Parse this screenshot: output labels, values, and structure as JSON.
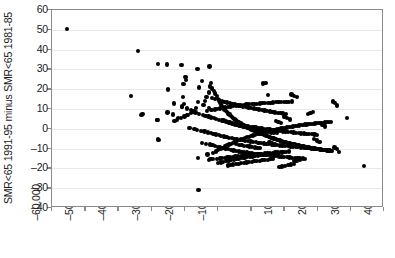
{
  "chart_data": {
    "type": "scatter",
    "title": "",
    "xlabel": "",
    "ylabel": "SMR<65 1991-95 minus SMR<65 1981-85",
    "xlim": [
      -60000,
      40000
    ],
    "ylim": [
      -40,
      60
    ],
    "xticks": [
      -60000,
      -50000,
      -40000,
      -30000,
      -20000,
      -10000,
      0,
      10000,
      20000,
      30000,
      40000
    ],
    "xtick_labels": [
      "–60,000",
      "–50,000",
      "–40,000",
      "–30,000",
      "–20,000",
      "–10,000",
      "0",
      "10,000",
      "20,000",
      "30,000",
      "40,000"
    ],
    "yticks": [
      -40,
      -30,
      -20,
      -10,
      0,
      10,
      20,
      30,
      40,
      50,
      60
    ],
    "ytick_labels": [
      "–40",
      "–30",
      "–20",
      "–10",
      "0",
      "10",
      "20",
      "30",
      "40",
      "50",
      "60"
    ],
    "grid": "horizontal",
    "legend": "none",
    "marker_color": "#000000",
    "marker_size": 4,
    "n_points": 620,
    "x": [
      -55400,
      -34100,
      -36200,
      -32700,
      -33000,
      -28100,
      -25400,
      -28200,
      -23600,
      -28300,
      -27800,
      -28100,
      -25000,
      -23200,
      -22100,
      -20600,
      -20300,
      -20800,
      -19800,
      -19600,
      -21000,
      -20400,
      -12600,
      -16200,
      -14900,
      -12200,
      -15800,
      -12400,
      -12800,
      -13500,
      -13900,
      -14400,
      -16700,
      -17200,
      -18100,
      -19200,
      -20100,
      -21200,
      -22400,
      -23100,
      -11800,
      -11200,
      -10900,
      -10400,
      -10100,
      -9800,
      -9400,
      -9100,
      -8700,
      -8300,
      -8000,
      -7600,
      -7200,
      -6900,
      -6500,
      -6100,
      -5800,
      -5400,
      -5000,
      -4700,
      -4300,
      -3900,
      -3600,
      -3200,
      -2800,
      -2500,
      -2100,
      -1700,
      -1400,
      -1000,
      -600,
      -300,
      100,
      500,
      900,
      1200,
      1600,
      2000,
      2300,
      2700,
      3100,
      3400,
      3800,
      4200,
      4500,
      4900,
      5300,
      5600,
      6000,
      6400,
      6700,
      7100,
      7500,
      7800,
      8200,
      8600,
      8900,
      9300,
      9700,
      10000,
      10400,
      10800,
      11100,
      11500,
      11900,
      12200,
      12600,
      13000,
      13300,
      13700,
      14100,
      14400,
      14800,
      15200,
      15500,
      15900,
      16300,
      16600,
      17000,
      17400,
      17700,
      18100,
      18500,
      18800,
      19200,
      19600,
      19900,
      20300,
      20700,
      21000,
      21400,
      21800,
      22100,
      22500,
      22900,
      23200,
      23600,
      24000,
      24300,
      25100,
      25800,
      26400,
      28900,
      33900,
      -15900,
      -12300,
      -16100,
      -13200,
      -11600,
      -10700,
      -9900,
      -9200,
      -8500,
      -7900,
      -7300,
      -6700,
      -6000,
      -5500,
      -4800,
      -4200,
      -3600,
      -3000,
      -2400,
      -1800,
      -1200,
      -600,
      0,
      600,
      1200,
      1800,
      2400,
      3000,
      3600,
      4200,
      4800,
      5400,
      6000,
      6600,
      7200,
      7800,
      8400,
      9000,
      9600,
      10200,
      10800,
      11400,
      12000,
      12600,
      13200,
      13800,
      14400,
      15000,
      15600,
      16200,
      16800,
      17400,
      18000,
      18600,
      19200,
      19800,
      20400,
      21000,
      21600,
      22200,
      22800,
      23400,
      24000,
      24600,
      25200,
      25800,
      -20900,
      -19400,
      -18200,
      -17500,
      -16800,
      -15700,
      -14600,
      -13800,
      -12900,
      -12100,
      -11300,
      -10500,
      -9700,
      -8900,
      -8100,
      -7300,
      -6500,
      -5700,
      -4900,
      -4100,
      -3300,
      -2500,
      -1700,
      -900,
      -100,
      700,
      1500,
      2300,
      3100,
      3900,
      4700,
      5500,
      6300,
      7100,
      7900,
      8700,
      9500,
      10300,
      11100,
      11900,
      12700,
      13500,
      14300,
      15100,
      15900,
      16700,
      17500,
      18300,
      19100,
      19900,
      20700,
      21500,
      22300,
      -18600,
      -17100,
      -16300,
      -15200,
      -14100,
      -13100,
      -12200,
      -11400,
      -10600,
      -9800,
      -9000,
      -8200,
      -7400,
      -6600,
      -5800,
      -5000,
      -4200,
      -3400,
      -2600,
      -1800,
      -1000,
      -200,
      600,
      1400,
      2200,
      3000,
      3800,
      4600,
      5400,
      6200,
      7000,
      7800,
      8600,
      9400,
      10200,
      11000,
      11800,
      12600,
      13400,
      14200,
      15000,
      15800,
      16600,
      17400,
      18200,
      19000,
      19800,
      20600,
      -14800,
      -13600,
      -12500,
      -11700,
      -10900,
      -10100,
      -9300,
      -8500,
      -7700,
      -6900,
      -6100,
      -5300,
      -4500,
      -3700,
      -2900,
      -2100,
      -1300,
      -500,
      300,
      1100,
      1900,
      2700,
      3500,
      4300,
      5100,
      5900,
      6700,
      7500,
      8300,
      9100,
      9900,
      10700,
      11500,
      12300,
      13100,
      13900,
      14700,
      15500,
      16300,
      17100,
      17900,
      18700,
      -13400,
      -12000,
      -11000,
      -10200,
      -9400,
      -8600,
      -7800,
      -7000,
      -6200,
      -5400,
      -4600,
      -3800,
      -3000,
      -2200,
      -1400,
      -600,
      200,
      1000,
      1800,
      2600,
      3400,
      4200,
      5000,
      5800,
      6600,
      7400,
      8200,
      9000,
      9800,
      10600,
      11400,
      12200,
      13000,
      13800,
      14600,
      -12700,
      -11500,
      -10300,
      -9500,
      -8700,
      -7900,
      -7100,
      -6300,
      -5500,
      -4700,
      -3900,
      -3100,
      -2300,
      -1500,
      -700,
      100,
      900,
      1700,
      2500,
      3300,
      4100,
      4900,
      5700,
      6500,
      7300,
      8100,
      8900,
      9700,
      10500,
      11300,
      12100,
      12900,
      13700,
      -11900,
      -10800,
      -9600,
      -8800,
      -8000,
      -7200,
      -6400,
      -5600,
      -4800,
      -4000,
      -3200,
      -2400,
      -1600,
      -800,
      0,
      800,
      1600,
      2400,
      3200,
      4000,
      4800,
      5600,
      6400,
      7200,
      8000,
      8800,
      9600,
      10400,
      11200,
      12000,
      12800,
      -10000,
      -9200,
      -8400,
      -7600,
      -6800,
      -6000,
      -5200,
      -4400,
      -3600,
      -2800,
      -2000,
      -1200,
      -400,
      400,
      1200,
      2000,
      2800,
      3600,
      4400,
      5200,
      6000,
      6800,
      7600,
      8400,
      9200,
      10000,
      10800,
      11600,
      -8300,
      -7500,
      -6700,
      -5900,
      -5100,
      -4300,
      -3500,
      -2700,
      -1900,
      -1100,
      -300,
      500,
      1300,
      2100,
      2900,
      3700,
      4500,
      5300,
      6100,
      6900,
      7700,
      8500,
      9300,
      10100,
      -7000,
      -6200,
      -5400,
      -4600,
      -3800,
      -3000,
      -2200,
      -1400,
      -600,
      200,
      1000,
      1800,
      2600,
      3400,
      4200,
      5000,
      5800,
      6600,
      7400,
      8200,
      9000,
      -5600,
      -4900,
      -4100,
      -3300,
      -2500,
      -1700,
      -900,
      -100,
      700,
      1500,
      2300,
      3100,
      3900,
      4700,
      5500,
      6300,
      7100,
      -4500,
      -3700,
      -2900,
      -2100,
      -1300,
      -500,
      300,
      1100,
      1900,
      2700,
      3500,
      4300,
      5100,
      -16000,
      -12800,
      -25200,
      -23900,
      -22700,
      -21600
    ],
    "y": [
      50.3,
      39.4,
      16.5,
      7.5,
      6.8,
      32.7,
      32.5,
      4.6,
      7.2,
      4.3,
      -5.5,
      -5.4,
      19.8,
      12.8,
      5.6,
      15.9,
      12.4,
      11.3,
      26.0,
      24.8,
      32.2,
      22.6,
      31.5,
      30.2,
      24.0,
      23.1,
      20.8,
      21.4,
      18.3,
      16.2,
      14.1,
      12.0,
      10.5,
      9.1,
      8.0,
      7.1,
      6.2,
      5.4,
      4.6,
      3.8,
      20.4,
      19.2,
      17.8,
      16.4,
      15.2,
      14.3,
      13.1,
      12.2,
      11.4,
      10.6,
      9.8,
      9.1,
      8.4,
      7.8,
      7.2,
      6.6,
      6.0,
      5.5,
      5.0,
      4.5,
      4.0,
      3.6,
      3.2,
      2.8,
      2.4,
      2.0,
      1.6,
      1.3,
      0.9,
      0.6,
      0.3,
      0.0,
      -0.3,
      -0.6,
      -0.9,
      -1.2,
      -1.5,
      -1.8,
      -2.0,
      -2.3,
      -2.6,
      -2.8,
      -3.1,
      -3.3,
      -3.6,
      -3.8,
      -4.0,
      -4.3,
      -4.5,
      -4.7,
      -4.9,
      -5.1,
      -5.3,
      -5.5,
      -5.7,
      -5.9,
      -6.1,
      -6.3,
      -6.5,
      -6.6,
      -6.8,
      -7.0,
      -7.1,
      -7.3,
      -7.5,
      -7.6,
      -7.8,
      -7.9,
      -8.1,
      -8.2,
      -8.4,
      -8.5,
      -8.6,
      -8.8,
      -8.9,
      -9.0,
      -9.1,
      -9.3,
      -9.4,
      -9.5,
      -9.6,
      -9.7,
      -9.8,
      -9.9,
      -10.0,
      -10.1,
      -10.2,
      -10.3,
      -10.4,
      -10.5,
      -10.6,
      -10.6,
      -10.7,
      -10.8,
      -10.9,
      -10.9,
      -11.0,
      -11.1,
      -11.1,
      -9.5,
      -10.3,
      -11.8,
      5.4,
      -18.9,
      -31.0,
      -15.1,
      -14.8,
      -13.0,
      -12.2,
      -11.5,
      -10.8,
      -10.2,
      -9.6,
      -9.0,
      -8.5,
      -8.0,
      -7.5,
      -7.0,
      -6.6,
      -6.2,
      -5.8,
      -5.4,
      -5.0,
      -4.7,
      -4.3,
      -4.0,
      -3.7,
      -3.4,
      -3.1,
      -2.8,
      -2.5,
      -2.2,
      -2.0,
      -1.7,
      -1.5,
      -1.2,
      -1.0,
      -0.8,
      -0.5,
      -0.3,
      -0.1,
      0.1,
      0.3,
      0.5,
      0.7,
      0.9,
      1.0,
      1.2,
      1.4,
      1.5,
      1.7,
      1.8,
      2.0,
      2.1,
      2.2,
      2.4,
      2.5,
      2.6,
      2.7,
      2.8,
      2.9,
      3.0,
      3.1,
      3.2,
      3.3,
      3.4,
      3.5,
      13.8,
      13.2,
      11.7,
      10.9,
      10.2,
      9.4,
      8.8,
      8.2,
      7.6,
      7.1,
      6.6,
      6.2,
      5.7,
      5.3,
      4.9,
      4.5,
      4.2,
      3.8,
      3.5,
      3.2,
      2.9,
      2.6,
      2.3,
      2.0,
      1.8,
      1.5,
      1.3,
      1.0,
      0.8,
      0.6,
      0.4,
      0.2,
      0.0,
      -0.2,
      -0.4,
      -0.6,
      -0.8,
      -0.9,
      -1.1,
      -1.3,
      -1.4,
      -1.6,
      -1.7,
      -1.9,
      -2.0,
      -2.1,
      -2.3,
      -2.4,
      -2.5,
      -2.6,
      -2.7,
      -2.9,
      -3.0,
      2.9,
      1.8,
      1.1,
      0.5,
      0.0,
      -0.5,
      -1.0,
      -1.4,
      -1.8,
      -2.2,
      -2.6,
      -2.9,
      -3.3,
      -3.6,
      -3.9,
      -4.2,
      -4.5,
      -4.8,
      -5.0,
      -5.3,
      -5.5,
      -5.8,
      -6.0,
      -6.2,
      -6.4,
      -6.6,
      -6.8,
      -7.0,
      -7.2,
      -7.4,
      -7.6,
      -7.7,
      -7.9,
      -8.1,
      -8.2,
      -8.4,
      -8.5,
      -8.7,
      -8.8,
      -8.9,
      -9.1,
      -9.2,
      -9.3,
      -9.4,
      -9.6,
      -9.7,
      -9.8,
      -9.9,
      -5.2,
      -5.9,
      -6.5,
      -7.0,
      -7.5,
      -7.9,
      -8.3,
      -8.7,
      -9.1,
      -9.4,
      -9.7,
      -10.0,
      -10.3,
      -10.6,
      -10.9,
      -11.1,
      -11.4,
      -11.6,
      -11.8,
      -12.0,
      -12.2,
      -12.4,
      -12.6,
      -12.8,
      -13.0,
      -13.1,
      -13.3,
      -13.4,
      -13.6,
      -13.7,
      -13.9,
      -14.0,
      -14.1,
      -14.3,
      -14.4,
      -14.5,
      -14.6,
      -14.7,
      -14.8,
      -14.9,
      -15.0,
      -15.1,
      7.4,
      8.1,
      8.6,
      9.0,
      9.4,
      9.7,
      10.0,
      10.3,
      10.5,
      10.8,
      11.0,
      11.2,
      11.4,
      11.6,
      11.8,
      11.9,
      12.1,
      12.2,
      12.4,
      12.5,
      12.6,
      12.7,
      12.8,
      12.9,
      13.0,
      13.1,
      13.2,
      13.3,
      13.4,
      13.5,
      13.5,
      13.6,
      13.7,
      13.7,
      13.8,
      -16.2,
      -16.0,
      -15.8,
      -15.6,
      -15.4,
      -15.2,
      -15.0,
      -14.8,
      -14.6,
      -14.5,
      -14.3,
      -14.1,
      -14.0,
      -13.8,
      -13.7,
      -13.5,
      -13.4,
      -13.2,
      -13.1,
      -13.0,
      -12.8,
      -12.7,
      -12.6,
      -12.5,
      -12.4,
      -12.2,
      -12.1,
      -12.0,
      -11.9,
      -11.8,
      -11.7,
      -11.6,
      -11.5,
      17.3,
      16.6,
      16.0,
      15.5,
      15.0,
      14.5,
      14.1,
      13.7,
      13.3,
      12.9,
      12.6,
      12.2,
      11.9,
      11.6,
      11.3,
      11.0,
      10.7,
      10.4,
      10.2,
      9.9,
      9.7,
      9.4,
      9.2,
      9.0,
      8.7,
      8.5,
      8.3,
      8.1,
      7.9,
      7.7,
      7.5,
      -18.4,
      -18.0,
      -17.6,
      -17.3,
      -17.0,
      -16.7,
      -16.4,
      -16.1,
      -15.8,
      -15.6,
      -15.3,
      -15.1,
      -14.9,
      -14.6,
      -14.4,
      -14.2,
      -14.0,
      -13.8,
      -13.6,
      -13.4,
      -13.2,
      -13.0,
      -12.9,
      -12.7,
      -12.5,
      -12.4,
      -12.2,
      -12.0,
      6.0,
      5.3,
      4.7,
      4.2,
      3.7,
      3.2,
      2.8,
      2.4,
      2.0,
      1.6,
      1.3,
      0.9,
      0.6,
      0.3,
      0.0,
      -0.3,
      -0.5,
      -0.8,
      -1.1,
      -1.3,
      -1.5,
      -1.8,
      -2.0,
      -2.2,
      -19.2,
      -19.0,
      -18.7,
      -18.5,
      -18.2,
      -18.0,
      -17.8,
      -17.6,
      -17.4,
      -17.2,
      -17.0,
      -16.8,
      -16.6,
      -16.4,
      -16.2,
      -16.1,
      -15.9,
      -15.7,
      -15.6,
      -15.4,
      -15.3,
      3.9,
      3.4,
      3.0,
      2.6,
      2.2,
      1.9,
      1.5,
      1.2,
      0.9,
      0.6,
      0.4,
      0.1,
      -0.1,
      -0.4,
      -0.6,
      -0.8,
      -1.0,
      -6.9,
      -7.2,
      -7.5,
      -7.8,
      -8.1,
      -8.3,
      -8.6,
      -8.8,
      -9.0,
      -9.2,
      -9.4,
      -9.6,
      -9.8,
      22.9,
      23.1,
      17.2,
      13.5,
      10.4,
      8.3
    ]
  }
}
